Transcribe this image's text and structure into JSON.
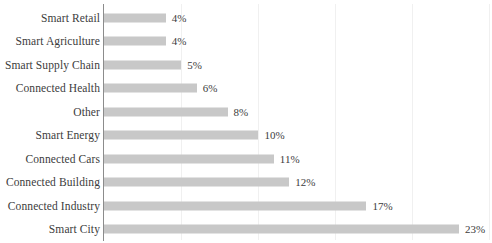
{
  "chart_data": {
    "type": "bar",
    "orientation": "horizontal",
    "title": "",
    "subtitle": "",
    "xlabel": "",
    "ylabel": "",
    "categories": [
      "Smart Retail",
      "Smart Agriculture",
      "Smart Supply Chain",
      "Connected Health",
      "Other",
      "Smart Energy",
      "Connected Cars",
      "Connected Building",
      "Connected Industry",
      "Smart City"
    ],
    "values": [
      4,
      4,
      5,
      6,
      8,
      10,
      11,
      12,
      17,
      23
    ],
    "value_labels": [
      "4%",
      "4%",
      "5%",
      "6%",
      "8%",
      "10%",
      "11%",
      "12%",
      "17%",
      "23%"
    ],
    "unit": "%",
    "xlim": [
      0,
      25
    ],
    "xticks": [
      0,
      5,
      10,
      15,
      20,
      25
    ],
    "xtick_labels": [
      "",
      "",
      "",
      "",
      "",
      ""
    ],
    "grid": "vertical-only",
    "legend": "none",
    "bar_color": "#c8c8c8",
    "gridline_color": "#f0f0f0",
    "axis_color": "#8c8c8c",
    "text_color": "#3c3c3c",
    "background": "#ffffff"
  }
}
